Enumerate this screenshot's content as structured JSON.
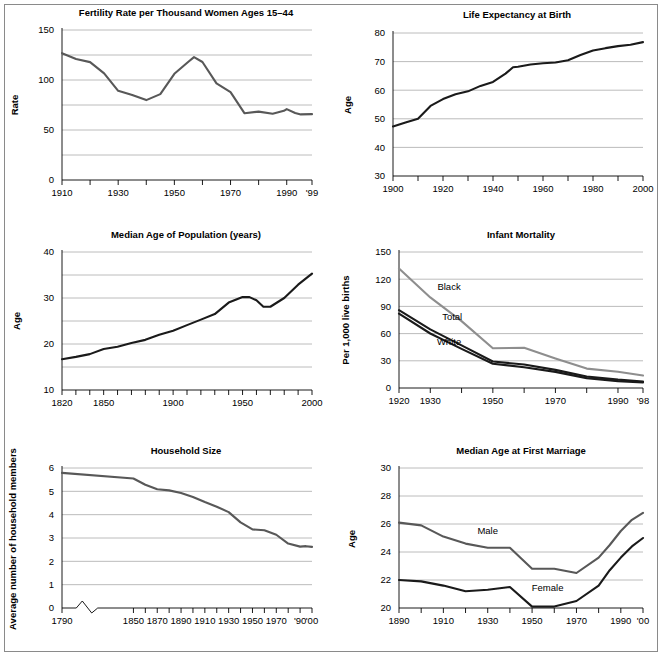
{
  "figure": {
    "width": 662,
    "height": 656,
    "border_color": "#8a8a8a",
    "background": "#ffffff"
  },
  "colors": {
    "line_dark": "#1a1a1a",
    "line_mid": "#585858",
    "line_light": "#8e8e8e",
    "gridline": "#b4b4b4",
    "axis": "#000000",
    "text": "#000000"
  },
  "chart_data": [
    {
      "id": "fertility-rate",
      "type": "line",
      "title": "Fertility Rate per Thousand Women Ages 15–44",
      "xlabel": "",
      "ylabel": "Rate",
      "xlim": [
        1910,
        1999
      ],
      "ylim": [
        0,
        150
      ],
      "grid": true,
      "gridlines": [
        25,
        50,
        75,
        100,
        125,
        150
      ],
      "yticks": [
        0,
        50,
        100,
        150
      ],
      "yticklabels": [
        "0",
        "50",
        "100",
        "150"
      ],
      "xticks": [
        1910,
        1920,
        1930,
        1940,
        1950,
        1960,
        1970,
        1980,
        1990,
        1999
      ],
      "xticklabels": [
        "1910",
        "",
        "1930",
        "",
        "1950",
        "",
        "1970",
        "",
        "1990",
        "'99"
      ],
      "legend": "none",
      "series": [
        {
          "name": "Fertility rate",
          "color": "#585858",
          "x": [
            1910,
            1915,
            1920,
            1925,
            1930,
            1935,
            1940,
            1945,
            1950,
            1955,
            1957,
            1960,
            1965,
            1970,
            1975,
            1980,
            1985,
            1989,
            1990,
            1993,
            1995,
            1999
          ],
          "values": [
            126.8,
            121.0,
            117.9,
            106.6,
            89.2,
            85.0,
            79.9,
            85.9,
            106.2,
            118.3,
            122.9,
            118.0,
            96.6,
            87.9,
            66.7,
            68.4,
            66.3,
            69.2,
            70.9,
            67.0,
            65.6,
            65.9
          ]
        }
      ]
    },
    {
      "id": "life-expectancy",
      "type": "line",
      "title": "Life Expectancy at Birth",
      "xlabel": "",
      "ylabel": "Age",
      "xlim": [
        1900,
        2000
      ],
      "ylim": [
        30,
        80
      ],
      "grid": true,
      "gridlines": [
        40,
        50,
        60,
        70,
        80
      ],
      "yticks": [
        30,
        40,
        50,
        60,
        70,
        80
      ],
      "yticklabels": [
        "30",
        "40",
        "50",
        "60",
        "70",
        "80"
      ],
      "xticks": [
        1900,
        1910,
        1920,
        1930,
        1940,
        1950,
        1960,
        1970,
        1980,
        1990,
        2000
      ],
      "xticklabels": [
        "1900",
        "",
        "1920",
        "",
        "1940",
        "",
        "1960",
        "",
        "1980",
        "",
        "2000"
      ],
      "legend": "none",
      "series": [
        {
          "name": "Life expectancy",
          "color": "#1a1a1a",
          "x": [
            1900,
            1905,
            1910,
            1915,
            1920,
            1925,
            1930,
            1935,
            1940,
            1945,
            1948,
            1950,
            1955,
            1960,
            1965,
            1970,
            1975,
            1980,
            1985,
            1990,
            1995,
            2000
          ],
          "values": [
            47.3,
            48.7,
            50.0,
            54.5,
            56.9,
            58.6,
            59.6,
            61.5,
            62.9,
            65.8,
            68.0,
            68.2,
            69.0,
            69.4,
            69.7,
            70.5,
            72.3,
            73.9,
            74.7,
            75.4,
            75.9,
            76.8
          ]
        }
      ]
    },
    {
      "id": "median-age-population",
      "type": "line",
      "title": "Median Age of Population (years)",
      "xlabel": "",
      "ylabel": "Age",
      "xlim": [
        1820,
        2000
      ],
      "ylim": [
        10,
        40
      ],
      "grid": true,
      "gridlines": [
        15,
        20,
        25,
        30,
        35,
        40
      ],
      "yticks": [
        10,
        20,
        30,
        40
      ],
      "yticklabels": [
        "10",
        "20",
        "30",
        "40"
      ],
      "xticks": [
        1820,
        1830,
        1840,
        1850,
        1860,
        1870,
        1880,
        1890,
        1900,
        1910,
        1920,
        1930,
        1940,
        1950,
        1960,
        1970,
        1980,
        1990,
        2000
      ],
      "xticklabels": [
        "1820",
        "",
        "",
        "1850",
        "",
        "",
        "",
        "",
        "1900",
        "",
        "",
        "",
        "",
        "1950",
        "",
        "",
        "",
        "",
        "2000"
      ],
      "legend": "none",
      "series": [
        {
          "name": "Median age",
          "color": "#1a1a1a",
          "x": [
            1820,
            1830,
            1840,
            1850,
            1860,
            1870,
            1880,
            1890,
            1900,
            1910,
            1920,
            1930,
            1940,
            1950,
            1955,
            1960,
            1965,
            1970,
            1980,
            1990,
            2000
          ],
          "values": [
            16.7,
            17.2,
            17.8,
            18.9,
            19.4,
            20.2,
            20.9,
            22.0,
            22.9,
            24.1,
            25.3,
            26.5,
            29.0,
            30.2,
            30.2,
            29.5,
            28.1,
            28.1,
            30.0,
            32.9,
            35.3
          ]
        }
      ]
    },
    {
      "id": "infant-mortality",
      "type": "line",
      "title": "Infant Mortality",
      "xlabel": "",
      "ylabel": "Per 1,000 live births",
      "xlim": [
        1920,
        1998
      ],
      "ylim": [
        0,
        150
      ],
      "grid": true,
      "gridlines": [
        30,
        60,
        90,
        120,
        150
      ],
      "yticks": [
        0,
        30,
        60,
        90,
        120,
        150
      ],
      "yticklabels": [
        "0",
        "30",
        "60",
        "90",
        "120",
        "150"
      ],
      "xticks": [
        1920,
        1930,
        1940,
        1950,
        1960,
        1970,
        1980,
        1990,
        1998
      ],
      "xticklabels": [
        "1920",
        "1930",
        "",
        "1950",
        "",
        "1970",
        "",
        "1990",
        "'98"
      ],
      "legend": "inline-labels",
      "series": [
        {
          "name": "Black",
          "label": "Black",
          "color": "#8e8e8e",
          "x": [
            1920,
            1930,
            1940,
            1950,
            1960,
            1970,
            1980,
            1990,
            1998
          ],
          "values": [
            131.7,
            99.9,
            73.8,
            43.9,
            44.3,
            32.6,
            21.4,
            18.0,
            13.8
          ]
        },
        {
          "name": "Total",
          "label": "Total",
          "color": "#1a1a1a",
          "x": [
            1920,
            1930,
            1940,
            1950,
            1960,
            1970,
            1980,
            1990,
            1998
          ],
          "values": [
            85.8,
            64.6,
            47.0,
            29.2,
            26.0,
            20.0,
            12.6,
            9.2,
            7.2
          ]
        },
        {
          "name": "White",
          "label": "White",
          "color": "#1a1a1a",
          "x": [
            1920,
            1930,
            1940,
            1950,
            1960,
            1970,
            1980,
            1990,
            1998
          ],
          "values": [
            82.1,
            60.1,
            43.2,
            26.8,
            22.9,
            17.8,
            10.9,
            7.6,
            6.0
          ]
        }
      ]
    },
    {
      "id": "household-size",
      "type": "line",
      "title": "Household Size",
      "xlabel": "",
      "ylabel": "Average number of household members",
      "xlim": [
        1790,
        2000
      ],
      "ylim": [
        0,
        6
      ],
      "grid": true,
      "gridlines": [
        1,
        2,
        3,
        4,
        5,
        6
      ],
      "yticks": [
        0,
        1,
        2,
        3,
        4,
        5,
        6
      ],
      "yticklabels": [
        "0",
        "1",
        "2",
        "3",
        "4",
        "5",
        "6"
      ],
      "axis_break": true,
      "xticks": [
        1790,
        1850,
        1860,
        1870,
        1880,
        1890,
        1900,
        1910,
        1920,
        1930,
        1940,
        1950,
        1960,
        1970,
        1980,
        1990,
        2000
      ],
      "xticklabels": [
        "1790",
        "1850",
        "",
        "1870",
        "",
        "1890",
        "",
        "1910",
        "",
        "1930",
        "",
        "1950",
        "",
        "1970",
        "",
        "'90",
        "'00"
      ],
      "legend": "none",
      "series": [
        {
          "name": "Household size",
          "color": "#585858",
          "x": [
            1790,
            1850,
            1860,
            1870,
            1880,
            1890,
            1900,
            1910,
            1920,
            1930,
            1940,
            1950,
            1960,
            1970,
            1980,
            1990,
            1995,
            2000
          ],
          "values": [
            5.79,
            5.55,
            5.28,
            5.09,
            5.04,
            4.93,
            4.76,
            4.54,
            4.34,
            4.11,
            3.67,
            3.37,
            3.33,
            3.14,
            2.76,
            2.63,
            2.65,
            2.62
          ]
        }
      ]
    },
    {
      "id": "median-age-first-marriage",
      "type": "line",
      "title": "Median Age at First Marriage",
      "xlabel": "",
      "ylabel": "Age",
      "xlim": [
        1890,
        2000
      ],
      "ylim": [
        20,
        30
      ],
      "grid": true,
      "gridlines": [
        22,
        24,
        26,
        28,
        30
      ],
      "yticks": [
        20,
        22,
        24,
        26,
        28,
        30
      ],
      "yticklabels": [
        "20",
        "22",
        "24",
        "26",
        "28",
        "30"
      ],
      "xticks": [
        1890,
        1900,
        1910,
        1920,
        1930,
        1940,
        1950,
        1960,
        1970,
        1980,
        1990,
        2000
      ],
      "xticklabels": [
        "1890",
        "",
        "1910",
        "",
        "1930",
        "",
        "1950",
        "",
        "1970",
        "",
        "1990",
        "'00"
      ],
      "legend": "inline-labels",
      "series": [
        {
          "name": "Male",
          "label": "Male",
          "color": "#585858",
          "x": [
            1890,
            1900,
            1910,
            1920,
            1930,
            1940,
            1950,
            1960,
            1970,
            1980,
            1985,
            1990,
            1995,
            2000
          ],
          "values": [
            26.1,
            25.9,
            25.1,
            24.6,
            24.3,
            24.3,
            22.8,
            22.8,
            22.5,
            23.6,
            24.5,
            25.5,
            26.3,
            26.8
          ]
        },
        {
          "name": "Female",
          "label": "Female",
          "color": "#1a1a1a",
          "x": [
            1890,
            1900,
            1910,
            1920,
            1930,
            1940,
            1950,
            1960,
            1970,
            1980,
            1985,
            1990,
            1995,
            2000
          ],
          "values": [
            22.0,
            21.9,
            21.6,
            21.2,
            21.3,
            21.5,
            20.1,
            20.1,
            20.5,
            21.6,
            22.7,
            23.6,
            24.4,
            25.0
          ]
        }
      ]
    }
  ],
  "annotations": {
    "infant_mortality": [
      {
        "text": "Black",
        "x": 1936,
        "y": 108
      },
      {
        "text": "Total",
        "x": 1937,
        "y": 75
      },
      {
        "text": "White",
        "x": 1936,
        "y": 47
      }
    ],
    "first_marriage": [
      {
        "text": "Male",
        "x": 1930,
        "y": 25.3
      },
      {
        "text": "Female",
        "x": 1957,
        "y": 21.2
      }
    ]
  }
}
